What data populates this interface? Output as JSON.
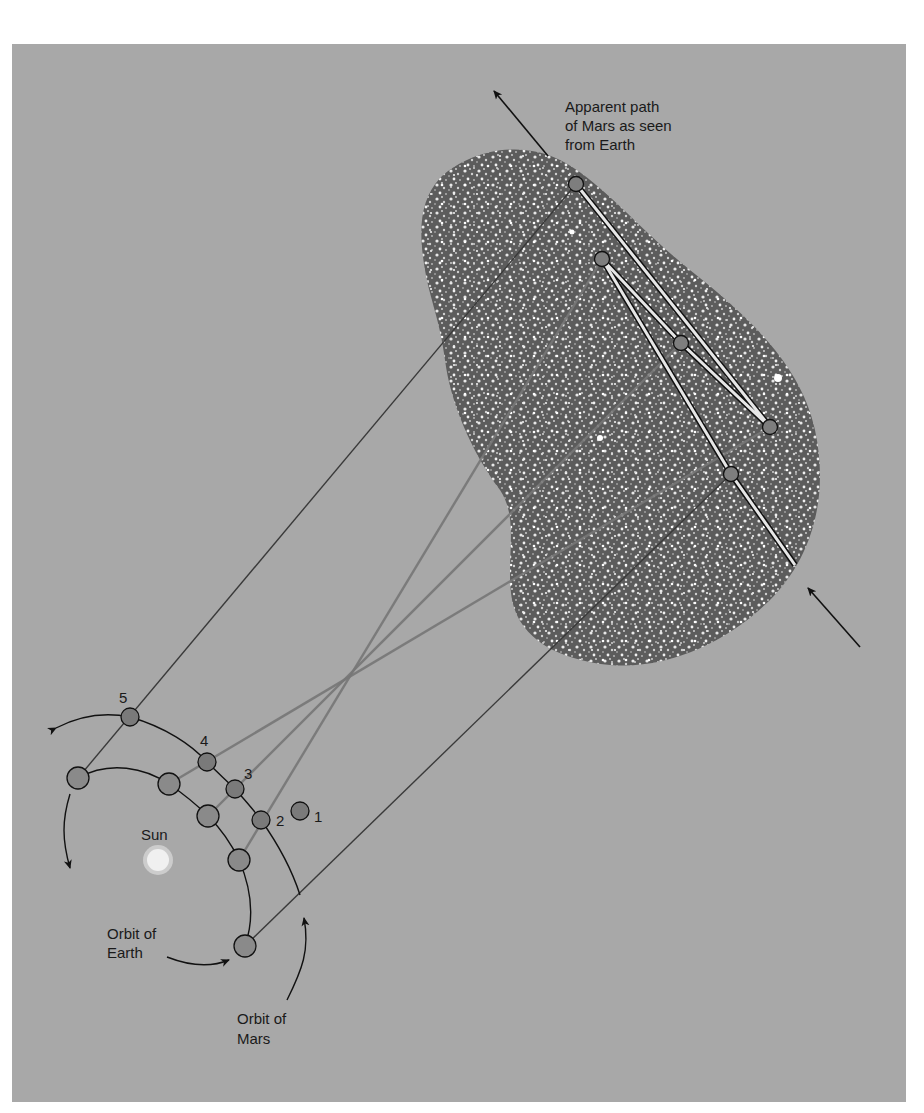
{
  "figure": {
    "top_cut_text": "by an observer on Earth at five different positions along Earth's orbit",
    "labels": {
      "apparent_path": [
        "Apparent path",
        "of Mars as seen",
        "from Earth"
      ],
      "sun": "Sun",
      "orbit_earth": [
        "Orbit of",
        "Earth"
      ],
      "orbit_mars": [
        "Orbit of",
        "Mars"
      ]
    },
    "position_numbers": [
      "1",
      "2",
      "3",
      "4",
      "5"
    ],
    "colors": {
      "background_panel": "#a8a8a8",
      "planet_fill": "#7e7e7e",
      "star_field": "#5a5a5a",
      "sight_line_dark": "#3a3a3a",
      "sight_line_light": "#7a7a7a",
      "sun": "#e8e8e8"
    }
  }
}
